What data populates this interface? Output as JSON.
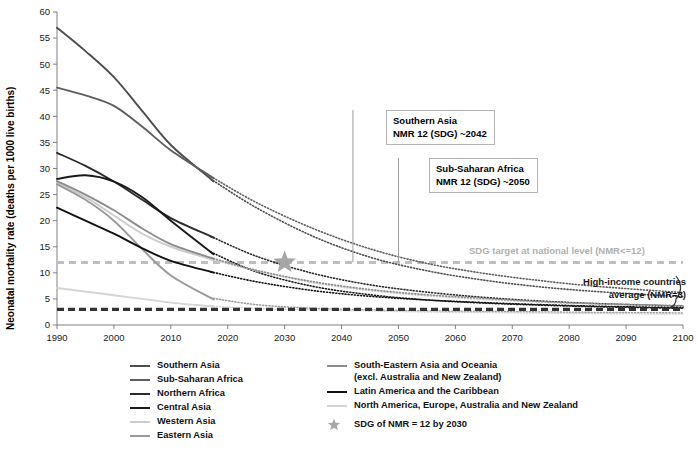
{
  "chart_data": {
    "type": "line",
    "title": "",
    "xlabel": "",
    "ylabel": "Neonatal mortality rate (deaths per 1000 live births)",
    "xlim": [
      1990,
      2100
    ],
    "ylim": [
      0,
      60
    ],
    "xticks": [
      1990,
      2000,
      2010,
      2020,
      2030,
      2040,
      2050,
      2060,
      2070,
      2080,
      2090,
      2100
    ],
    "yticks": [
      0,
      5,
      10,
      15,
      20,
      25,
      30,
      35,
      40,
      45,
      50,
      55,
      60
    ],
    "grid": false,
    "legend_position": "bottom",
    "observed_range": [
      1990,
      2017
    ],
    "projected_range": [
      2017,
      2100
    ],
    "series": [
      {
        "name": "Southern Asia",
        "color": "#4d4d4d",
        "x": [
          1990,
          1995,
          2000,
          2005,
          2010,
          2017,
          2025,
          2035,
          2045,
          2055,
          2065,
          2075,
          2085,
          2100
        ],
        "values": [
          57.0,
          52.5,
          47.5,
          41.0,
          34.5,
          28.0,
          22.5,
          17.0,
          13.0,
          10.4,
          8.6,
          7.3,
          6.4,
          5.4
        ]
      },
      {
        "name": "Sub-Saharan Africa",
        "color": "#5e5e5e",
        "x": [
          1990,
          1995,
          2000,
          2005,
          2010,
          2017,
          2025,
          2035,
          2045,
          2055,
          2065,
          2075,
          2085,
          2100
        ],
        "values": [
          45.5,
          44.0,
          42.0,
          38.0,
          33.5,
          28.5,
          23.5,
          18.5,
          14.6,
          11.8,
          9.9,
          8.5,
          7.4,
          6.2
        ]
      },
      {
        "name": "Northern Africa",
        "color": "#2b2b2b",
        "x": [
          1990,
          1995,
          2000,
          2005,
          2010,
          2017,
          2025,
          2035,
          2045,
          2055,
          2065,
          2075,
          2085,
          2100
        ],
        "values": [
          33.0,
          30.5,
          27.5,
          24.0,
          20.5,
          17.0,
          13.2,
          9.9,
          7.7,
          6.3,
          5.3,
          4.6,
          4.1,
          3.6
        ]
      },
      {
        "name": "Central Asia",
        "color": "#1a1a1a",
        "x": [
          1990,
          1995,
          2000,
          2005,
          2010,
          2017,
          2025,
          2035,
          2045,
          2055,
          2065,
          2075,
          2085,
          2100
        ],
        "values": [
          28.0,
          28.7,
          27.5,
          24.5,
          20.0,
          14.0,
          10.2,
          7.4,
          5.8,
          4.8,
          4.2,
          3.8,
          3.5,
          3.2
        ]
      },
      {
        "name": "Western Asia",
        "color": "#cccccc",
        "x": [
          1990,
          1995,
          2000,
          2005,
          2010,
          2017,
          2025,
          2035,
          2045,
          2055,
          2065,
          2075,
          2085,
          2100
        ],
        "values": [
          27.3,
          24.5,
          21.0,
          17.5,
          15.0,
          12.6,
          10.4,
          8.1,
          6.6,
          5.6,
          4.9,
          4.4,
          4.0,
          3.6
        ]
      },
      {
        "name": "Eastern Asia",
        "color": "#9a9a9a",
        "x": [
          1990,
          1995,
          2000,
          2005,
          2010,
          2017,
          2025,
          2035,
          2045,
          2055,
          2065,
          2075,
          2085,
          2100
        ],
        "values": [
          27.0,
          24.0,
          20.0,
          14.5,
          9.5,
          5.2,
          3.9,
          3.2,
          2.9,
          2.7,
          2.6,
          2.5,
          2.4,
          2.3
        ]
      },
      {
        "name": "South-Eastern Asia and Oceania (excl. Australia and New Zealand)",
        "color": "#8c8c8c",
        "x": [
          1990,
          1995,
          2000,
          2005,
          2010,
          2017,
          2025,
          2035,
          2045,
          2055,
          2065,
          2075,
          2085,
          2100
        ],
        "values": [
          27.6,
          25.0,
          22.0,
          18.5,
          15.5,
          12.9,
          10.5,
          8.3,
          6.8,
          5.8,
          5.1,
          4.5,
          4.1,
          3.7
        ]
      },
      {
        "name": "Latin America and the Caribbean",
        "color": "#111111",
        "x": [
          1990,
          1995,
          2000,
          2005,
          2010,
          2017,
          2025,
          2035,
          2045,
          2055,
          2065,
          2075,
          2085,
          2100
        ],
        "values": [
          22.5,
          20.0,
          17.5,
          14.7,
          12.3,
          10.2,
          8.3,
          6.6,
          5.5,
          4.8,
          4.3,
          3.9,
          3.6,
          3.3
        ]
      },
      {
        "name": "North America, Europe, Australia and New Zealand",
        "color": "#d4d4d4",
        "x": [
          1990,
          1995,
          2000,
          2005,
          2010,
          2017,
          2025,
          2035,
          2045,
          2055,
          2065,
          2075,
          2085,
          2100
        ],
        "values": [
          7.1,
          6.4,
          5.7,
          5.0,
          4.3,
          3.6,
          3.2,
          2.9,
          2.7,
          2.5,
          2.4,
          2.3,
          2.2,
          2.1
        ]
      }
    ],
    "reference_lines": [
      {
        "name": "SDG target at national level",
        "value": 12,
        "color": "#bfbfbf",
        "style": "dashed"
      },
      {
        "name": "High-income countries average",
        "value": 3,
        "color": "#333333",
        "style": "dashed"
      }
    ],
    "markers": [
      {
        "name": "SDG of NMR = 12 by 2030",
        "x": 2030,
        "y": 12,
        "symbol": "star",
        "color": "#a6a6a6"
      }
    ],
    "annotations": [
      {
        "id": "southern-asia",
        "line1": "Southern Asia",
        "line2": "NMR 12 (SDG) ~2042",
        "pointer_x": 2042,
        "pointer_y": 12
      },
      {
        "id": "sub-saharan-africa",
        "line1": "Sub-Saharan Africa",
        "line2": "NMR 12 (SDG) ~2050",
        "pointer_x": 2050,
        "pointer_y": 12
      }
    ]
  },
  "labels": {
    "y_axis_title": "Neonatal mortality rate (deaths per 1000 live births)",
    "sdg_target_note": "SDG target at national level (NMR<=12)",
    "high_income_note_line1": "High-income countries",
    "high_income_note_line2": "average (NMR=3)"
  },
  "legend": {
    "column_left": [
      {
        "label": "Southern Asia",
        "color": "#4d4d4d"
      },
      {
        "label": "Sub-Saharan Africa",
        "color": "#5e5e5e"
      },
      {
        "label": "Northern Africa",
        "color": "#2b2b2b"
      },
      {
        "label": "Central Asia",
        "color": "#1a1a1a"
      },
      {
        "label": "Western Asia",
        "color": "#cccccc"
      },
      {
        "label": "Eastern Asia",
        "color": "#9a9a9a"
      }
    ],
    "column_right": [
      {
        "label": "South-Eastern Asia and Oceania",
        "label2": "(excl. Australia and New Zealand)",
        "color": "#8c8c8c"
      },
      {
        "label": "Latin America and the Caribbean",
        "label2": "",
        "color": "#111111"
      },
      {
        "label": "North America, Europe, Australia and New Zealand",
        "label2": "",
        "color": "#d4d4d4"
      }
    ],
    "marker_entry": {
      "label": "SDG of NMR = 12 by 2030",
      "color": "#a6a6a6"
    }
  },
  "annotation_boxes": {
    "southern_asia": {
      "line1": "Southern Asia",
      "line2": "NMR 12 (SDG) ~2042"
    },
    "sub_saharan": {
      "line1": "Sub-Saharan Africa",
      "line2": "NMR 12 (SDG) ~2050"
    }
  }
}
